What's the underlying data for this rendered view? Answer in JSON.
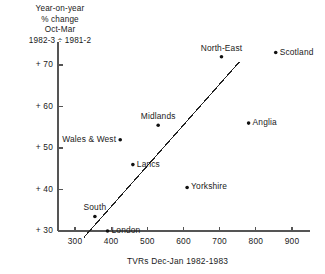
{
  "chart_data": {
    "type": "scatter",
    "title": "",
    "ylabel_lines": [
      "Year-on-year",
      "% change",
      "Oct-Mar",
      "1982-3 ÷ 1981-2"
    ],
    "xlabel": "TVRs Dec-Jan 1982-1983",
    "xlim": [
      270,
      930
    ],
    "ylim": [
      28,
      75
    ],
    "xticks": [
      300,
      400,
      500,
      600,
      700,
      800,
      900
    ],
    "xtick_labels": [
      "300",
      "400",
      "500",
      "600",
      "700",
      "800",
      "900"
    ],
    "yticks": [
      30,
      40,
      50,
      60,
      70
    ],
    "ytick_labels": [
      "+ 30",
      "+ 40",
      "+ 50",
      "+ 60",
      "+ 70"
    ],
    "grid": false,
    "legend": "none",
    "marker_color": "#111111",
    "axis_color": "#555555",
    "line_color": "#222222",
    "points": [
      {
        "label": "Scotland",
        "x": 855,
        "y": 73.0,
        "label_pos": "right"
      },
      {
        "label": "North-East",
        "x": 705,
        "y": 72.0,
        "label_pos": "above"
      },
      {
        "label": "Anglia",
        "x": 780,
        "y": 56.0,
        "label_pos": "right"
      },
      {
        "label": "Midlands",
        "x": 530,
        "y": 55.5,
        "label_pos": "above"
      },
      {
        "label": "Wales & West",
        "x": 425,
        "y": 52.0,
        "label_pos": "left"
      },
      {
        "label": "Lancs",
        "x": 460,
        "y": 46.0,
        "label_pos": "right"
      },
      {
        "label": "Yorkshire",
        "x": 610,
        "y": 40.5,
        "label_pos": "right"
      },
      {
        "label": "South",
        "x": 355,
        "y": 33.5,
        "label_pos": "above"
      },
      {
        "label": "London",
        "x": 390,
        "y": 30.0,
        "label_pos": "right"
      }
    ],
    "trend_line": {
      "x0": 325,
      "y0": 28.5,
      "x1": 755,
      "y1": 70.8
    }
  }
}
